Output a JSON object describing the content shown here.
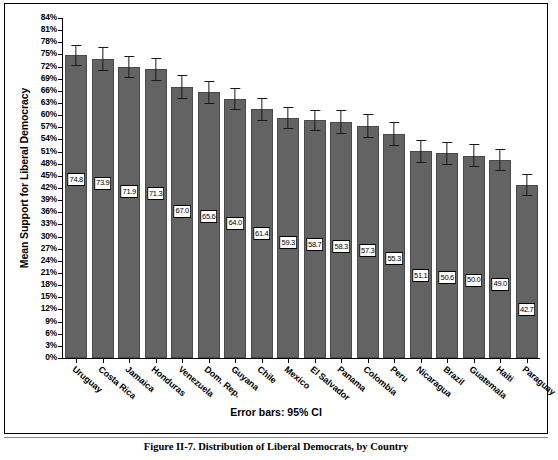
{
  "figure": {
    "caption": "Figure II-7. Distribution of Liberal Democrats, by Country",
    "errorbar_note": "Error bars: 95% CI"
  },
  "chart_data": {
    "type": "bar",
    "title": "",
    "xlabel": "",
    "ylabel": "Mean Support for Liberal Democracy",
    "ylim": [
      0,
      84
    ],
    "ytick_step": 3,
    "ytick_labels": [
      "0%",
      "3%",
      "6%",
      "9%",
      "12%",
      "15%",
      "18%",
      "21%",
      "24%",
      "27%",
      "30%",
      "33%",
      "36%",
      "39%",
      "42%",
      "45%",
      "48%",
      "51%",
      "54%",
      "57%",
      "60%",
      "63%",
      "66%",
      "69%",
      "72%",
      "75%",
      "78%",
      "81%",
      "84%"
    ],
    "grid": false,
    "legend": "none",
    "error_bars": "95% CI",
    "bar_color": "#636363",
    "categories": [
      "Uruguay",
      "Costa Rica",
      "Jamaica",
      "Honduras",
      "Venezuela",
      "Dom. Rep.",
      "Guyana",
      "Chile",
      "Mexico",
      "El Salvador",
      "Panama",
      "Colombia",
      "Peru",
      "Nicaragua",
      "Brazil",
      "Guatemala",
      "Haiti",
      "Paraguay"
    ],
    "values": [
      74.8,
      73.9,
      71.9,
      71.3,
      67.0,
      65.6,
      64.0,
      61.4,
      59.3,
      58.7,
      58.3,
      57.3,
      55.3,
      51.1,
      50.6,
      50.0,
      49.0,
      42.7
    ],
    "value_labels": [
      "74.8",
      "73.9",
      "71.9",
      "71.3",
      "67.0",
      "65.6",
      "64.0",
      "61.4",
      "59.3",
      "58.7",
      "58.3",
      "57.3",
      "55.3",
      "51.1",
      "50.6",
      "50.0",
      "49.0",
      "42.7"
    ],
    "ci_low": [
      72.2,
      71.0,
      69.2,
      68.5,
      64.0,
      62.8,
      61.2,
      58.5,
      56.5,
      56.0,
      55.4,
      54.4,
      52.4,
      48.3,
      47.8,
      47.2,
      46.3,
      40.0
    ],
    "ci_high": [
      77.4,
      76.8,
      74.6,
      74.1,
      70.0,
      68.4,
      66.8,
      64.3,
      62.1,
      61.4,
      61.2,
      60.2,
      58.2,
      53.9,
      53.4,
      52.8,
      51.7,
      45.4
    ]
  }
}
